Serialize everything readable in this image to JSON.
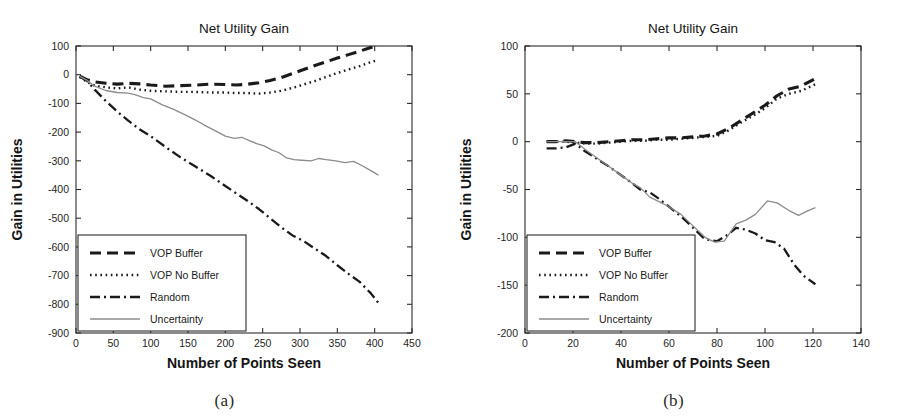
{
  "figure": {
    "panels": [
      {
        "id": "a",
        "caption": "(a)",
        "chart_data": {
          "type": "line",
          "title": "Net Utility Gain",
          "xlabel": "Number of Points Seen",
          "ylabel": "Gain in Utilities",
          "xlim": [
            0,
            450
          ],
          "ylim": [
            -900,
            100
          ],
          "xticks": [
            0,
            50,
            100,
            150,
            200,
            250,
            300,
            350,
            400,
            450
          ],
          "yticks": [
            100,
            0,
            -100,
            -200,
            -300,
            -400,
            -500,
            -600,
            -700,
            -800,
            -900
          ],
          "grid": false,
          "legend_position": "lower-left",
          "series": [
            {
              "name": "VOP Buffer",
              "style": "dashed",
              "color": "#1a1a1a",
              "x": [
                5,
                15,
                25,
                40,
                55,
                70,
                85,
                100,
                120,
                140,
                160,
                180,
                200,
                215,
                230,
                245,
                260,
                275,
                290,
                305,
                320,
                335,
                350,
                365,
                380,
                395,
                405
              ],
              "y": [
                -5,
                -18,
                -25,
                -30,
                -33,
                -30,
                -32,
                -36,
                -40,
                -38,
                -36,
                -33,
                -34,
                -36,
                -33,
                -28,
                -20,
                -10,
                4,
                18,
                32,
                45,
                58,
                70,
                82,
                95,
                103
              ]
            },
            {
              "name": "VOP No Buffer",
              "style": "dotted",
              "color": "#1a1a1a",
              "x": [
                5,
                15,
                25,
                40,
                55,
                70,
                85,
                100,
                120,
                140,
                160,
                180,
                200,
                215,
                230,
                245,
                260,
                275,
                290,
                305,
                320,
                335,
                350,
                365,
                380,
                395,
                405
              ],
              "y": [
                -8,
                -26,
                -38,
                -44,
                -48,
                -44,
                -52,
                -56,
                -58,
                -60,
                -60,
                -62,
                -62,
                -64,
                -64,
                -66,
                -62,
                -56,
                -46,
                -34,
                -22,
                -8,
                6,
                18,
                30,
                44,
                52
              ]
            },
            {
              "name": "Random",
              "style": "dashdot",
              "color": "#1a1a1a",
              "x": [
                5,
                15,
                25,
                40,
                55,
                70,
                85,
                100,
                120,
                140,
                160,
                180,
                200,
                215,
                230,
                245,
                260,
                275,
                290,
                305,
                320,
                335,
                350,
                365,
                380,
                395,
                405
              ],
              "y": [
                -6,
                -22,
                -52,
                -92,
                -128,
                -160,
                -190,
                -214,
                -252,
                -288,
                -320,
                -352,
                -388,
                -414,
                -440,
                -468,
                -500,
                -532,
                -560,
                -580,
                -606,
                -632,
                -664,
                -694,
                -722,
                -762,
                -795
              ]
            },
            {
              "name": "Uncertainty",
              "style": "solid",
              "color": "#8c8c8c",
              "x": [
                5,
                15,
                25,
                40,
                55,
                70,
                80,
                90,
                100,
                115,
                130,
                145,
                160,
                175,
                190,
                200,
                212,
                222,
                232,
                242,
                252,
                262,
                272,
                282,
                292,
                302,
                315,
                325,
                335,
                348,
                360,
                372,
                384,
                396,
                405
              ],
              "y": [
                -6,
                -20,
                -40,
                -55,
                -62,
                -64,
                -70,
                -80,
                -84,
                -104,
                -120,
                -138,
                -158,
                -180,
                -200,
                -214,
                -222,
                -218,
                -230,
                -240,
                -248,
                -262,
                -272,
                -290,
                -296,
                -298,
                -300,
                -292,
                -296,
                -300,
                -306,
                -302,
                -318,
                -336,
                -350
              ]
            }
          ]
        }
      },
      {
        "id": "b",
        "caption": "(b)",
        "chart_data": {
          "type": "line",
          "title": "Net Utility Gain",
          "xlabel": "Number of Points Seen",
          "ylabel": "Gain in Utilities",
          "xlim": [
            0,
            140
          ],
          "ylim": [
            -200,
            100
          ],
          "xticks": [
            0,
            20,
            40,
            60,
            80,
            100,
            120,
            140
          ],
          "yticks": [
            100,
            50,
            0,
            -50,
            -100,
            -150,
            -200
          ],
          "grid": false,
          "legend_position": "lower-left",
          "series": [
            {
              "name": "VOP Buffer",
              "style": "dashed",
              "color": "#1a1a1a",
              "x": [
                9,
                13,
                17,
                21,
                25,
                30,
                35,
                40,
                45,
                50,
                55,
                60,
                65,
                70,
                75,
                80,
                85,
                90,
                95,
                100,
                105,
                110,
                115,
                121
              ],
              "y": [
                0,
                0,
                1,
                0,
                -1,
                -1,
                0,
                1,
                2,
                2,
                3,
                4,
                4,
                5,
                6,
                8,
                14,
                22,
                30,
                38,
                48,
                55,
                58,
                66
              ]
            },
            {
              "name": "VOP No Buffer",
              "style": "dotted",
              "color": "#1a1a1a",
              "x": [
                9,
                13,
                17,
                21,
                25,
                30,
                35,
                40,
                45,
                50,
                55,
                60,
                65,
                70,
                75,
                80,
                85,
                90,
                95,
                100,
                105,
                110,
                115,
                121
              ],
              "y": [
                0,
                0,
                0,
                -1,
                -2,
                -2,
                -1,
                0,
                1,
                1,
                2,
                2,
                3,
                4,
                5,
                6,
                12,
                20,
                27,
                35,
                45,
                50,
                53,
                60
              ]
            },
            {
              "name": "Random",
              "style": "dashdot",
              "color": "#1a1a1a",
              "x": [
                9,
                13,
                17,
                21,
                25,
                30,
                35,
                40,
                45,
                48,
                52,
                56,
                60,
                65,
                70,
                75,
                80,
                84,
                88,
                92,
                96,
                100,
                104,
                108,
                112,
                116,
                121
              ],
              "y": [
                -7,
                -7,
                -6,
                -2,
                -10,
                -18,
                -26,
                -35,
                -44,
                -50,
                -53,
                -60,
                -68,
                -78,
                -90,
                -102,
                -104,
                -98,
                -90,
                -92,
                -96,
                -103,
                -105,
                -112,
                -128,
                -140,
                -149
              ]
            },
            {
              "name": "Uncertainty",
              "style": "solid",
              "color": "#8c8c8c",
              "x": [
                9,
                13,
                17,
                21,
                25,
                30,
                35,
                40,
                45,
                48,
                52,
                56,
                60,
                65,
                70,
                75,
                79,
                83,
                88,
                92,
                96,
                101,
                105,
                110,
                114,
                118,
                121
              ],
              "y": [
                0,
                0,
                0,
                0,
                -8,
                -17,
                -26,
                -35,
                -44,
                -48,
                -58,
                -63,
                -68,
                -76,
                -88,
                -100,
                -105,
                -104,
                -86,
                -82,
                -76,
                -62,
                -64,
                -72,
                -77,
                -72,
                -69
              ]
            }
          ]
        }
      }
    ]
  }
}
